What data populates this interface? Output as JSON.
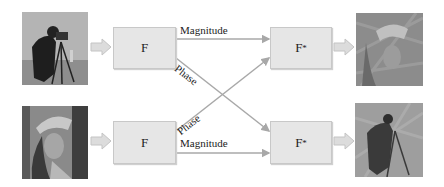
{
  "diagram": {
    "colors": {
      "box_fill": "#e6e6e6",
      "box_border": "#c8c8c8",
      "line": "#a8a8a8",
      "arrow_fill": "#dcdcdc",
      "text": "#222222"
    },
    "inputs": [
      {
        "name": "cameraman",
        "label": "cameraman-image"
      },
      {
        "name": "lena",
        "label": "lena-image"
      }
    ],
    "transform_box": {
      "label": "F"
    },
    "inverse_box": {
      "label": "F",
      "superscript": "*"
    },
    "edges": {
      "top_magnitude": "Magnitude",
      "top_phase": "Phase",
      "bottom_phase": "Phase",
      "bottom_magnitude": "Magnitude"
    },
    "outputs": [
      {
        "name": "reconstruction-lena-phase",
        "label": "output-image-top"
      },
      {
        "name": "reconstruction-cameraman-phase",
        "label": "output-image-bottom"
      }
    ]
  }
}
